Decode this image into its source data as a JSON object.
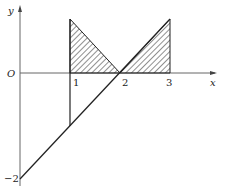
{
  "diagram": {
    "axes": {
      "x_label": "x",
      "y_label": "y",
      "origin_label": "O"
    },
    "ticks": {
      "x1": "1",
      "x2": "2",
      "x3": "3",
      "y_neg2": "−2"
    },
    "line": {
      "description": "y = x - 2",
      "from": [
        0,
        -2
      ],
      "to": [
        3,
        1
      ]
    },
    "shaded_regions": [
      {
        "vertices": [
          [
            1,
            1
          ],
          [
            1,
            0
          ],
          [
            2,
            0
          ]
        ],
        "fill": "hatched"
      },
      {
        "vertices": [
          [
            2,
            0
          ],
          [
            3,
            0
          ],
          [
            3,
            1
          ]
        ],
        "fill": "hatched"
      }
    ],
    "vertical_segment": {
      "x": 1,
      "from_y": -1,
      "to_y": 1
    },
    "colors": {
      "stroke": "#222222",
      "axis": "#666666",
      "background": "#ffffff"
    }
  }
}
